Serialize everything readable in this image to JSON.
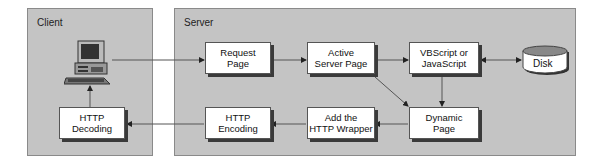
{
  "panels": {
    "client": {
      "title": "Client"
    },
    "server": {
      "title": "Server"
    }
  },
  "nodes": {
    "request_page": "Request\nPage",
    "active_server_page": "Active\nServer Page",
    "vbscript": "VBScript or\nJavaScript",
    "disk": "Disk",
    "dynamic_page": "Dynamic\nPage",
    "add_wrapper": "Add the\nHTTP Wrapper",
    "http_encoding": "HTTP\nEncoding",
    "http_decoding": "HTTP\nDecoding"
  },
  "icons": {
    "computer": "computer-icon",
    "disk": "disk-cylinder-icon"
  },
  "edges": [
    {
      "from": "client-computer",
      "to": "request_page"
    },
    {
      "from": "request_page",
      "to": "active_server_page"
    },
    {
      "from": "active_server_page",
      "to": "vbscript"
    },
    {
      "from": "vbscript",
      "to": "disk",
      "bidirectional": true
    },
    {
      "from": "vbscript",
      "to": "dynamic_page"
    },
    {
      "from": "active_server_page",
      "to": "dynamic_page"
    },
    {
      "from": "dynamic_page",
      "to": "add_wrapper"
    },
    {
      "from": "add_wrapper",
      "to": "http_encoding"
    },
    {
      "from": "http_encoding",
      "to": "http_decoding"
    },
    {
      "from": "http_decoding",
      "to": "client-computer"
    }
  ],
  "colors": {
    "panel": "#c4c4c4",
    "box": "#ffffff",
    "line": "#555555"
  }
}
